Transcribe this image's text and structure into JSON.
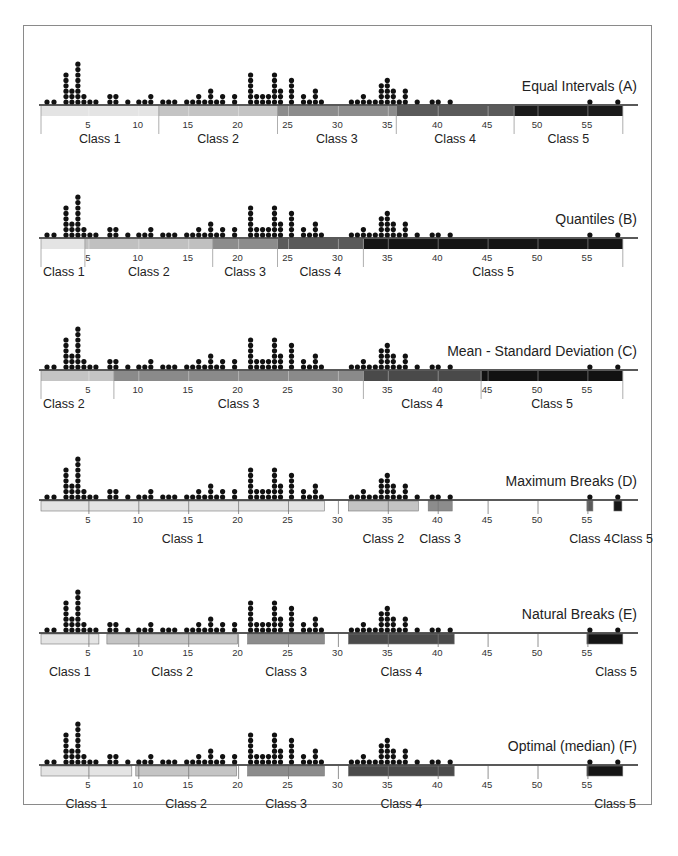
{
  "chart_data": {
    "type": "dot-strip",
    "xlabel": "",
    "ylabel": "",
    "xlim": [
      0,
      58
    ],
    "ticks": [
      5,
      10,
      15,
      20,
      25,
      30,
      35,
      40,
      45,
      50,
      55
    ],
    "dot_histogram": [
      {
        "x": 0.8,
        "n": 1
      },
      {
        "x": 1.5,
        "n": 1
      },
      {
        "x": 2.7,
        "n": 6
      },
      {
        "x": 3.3,
        "n": 3
      },
      {
        "x": 3.9,
        "n": 8
      },
      {
        "x": 4.5,
        "n": 2
      },
      {
        "x": 5.1,
        "n": 1
      },
      {
        "x": 5.7,
        "n": 1
      },
      {
        "x": 7.1,
        "n": 2
      },
      {
        "x": 7.7,
        "n": 2
      },
      {
        "x": 8.9,
        "n": 1
      },
      {
        "x": 10.0,
        "n": 1
      },
      {
        "x": 10.6,
        "n": 1
      },
      {
        "x": 11.2,
        "n": 2
      },
      {
        "x": 12.4,
        "n": 1
      },
      {
        "x": 13.0,
        "n": 1
      },
      {
        "x": 13.6,
        "n": 1
      },
      {
        "x": 14.8,
        "n": 1
      },
      {
        "x": 15.4,
        "n": 1
      },
      {
        "x": 16.0,
        "n": 2
      },
      {
        "x": 16.6,
        "n": 1
      },
      {
        "x": 17.2,
        "n": 3
      },
      {
        "x": 17.8,
        "n": 1
      },
      {
        "x": 18.4,
        "n": 2
      },
      {
        "x": 19.6,
        "n": 2
      },
      {
        "x": 21.2,
        "n": 6
      },
      {
        "x": 21.8,
        "n": 2
      },
      {
        "x": 22.4,
        "n": 2
      },
      {
        "x": 23.0,
        "n": 2
      },
      {
        "x": 23.6,
        "n": 6
      },
      {
        "x": 24.2,
        "n": 3
      },
      {
        "x": 25.3,
        "n": 5
      },
      {
        "x": 26.5,
        "n": 2
      },
      {
        "x": 27.1,
        "n": 1
      },
      {
        "x": 27.7,
        "n": 3
      },
      {
        "x": 28.3,
        "n": 1
      },
      {
        "x": 31.3,
        "n": 1
      },
      {
        "x": 31.9,
        "n": 1
      },
      {
        "x": 32.5,
        "n": 2
      },
      {
        "x": 33.1,
        "n": 1
      },
      {
        "x": 33.7,
        "n": 1
      },
      {
        "x": 34.3,
        "n": 4
      },
      {
        "x": 34.9,
        "n": 5
      },
      {
        "x": 35.5,
        "n": 3
      },
      {
        "x": 36.1,
        "n": 1
      },
      {
        "x": 36.7,
        "n": 3
      },
      {
        "x": 37.9,
        "n": 1
      },
      {
        "x": 39.4,
        "n": 1
      },
      {
        "x": 40.0,
        "n": 1
      },
      {
        "x": 41.2,
        "n": 1
      },
      {
        "x": 55.2,
        "n": 1
      },
      {
        "x": 58.0,
        "n": 1
      }
    ],
    "panels": [
      {
        "id": "A",
        "title": "Equal Intervals (A)",
        "classes": [
          {
            "label": "Class 1",
            "from": 0.2,
            "to": 12.0,
            "color": "#e4e4e4"
          },
          {
            "label": "Class 2",
            "from": 12.0,
            "to": 23.9,
            "color": "#c4c4c4"
          },
          {
            "label": "Class 3",
            "from": 23.9,
            "to": 35.8,
            "color": "#8c8c8c"
          },
          {
            "label": "Class 4",
            "from": 35.8,
            "to": 47.6,
            "color": "#5a5a5a"
          },
          {
            "label": "Class 5",
            "from": 47.6,
            "to": 58.5,
            "color": "#1a1a1a"
          }
        ],
        "bar": "continuous"
      },
      {
        "id": "B",
        "title": "Quantiles (B)",
        "classes": [
          {
            "label": "Class 1",
            "from": 0.2,
            "to": 4.6,
            "color": "#e4e4e4"
          },
          {
            "label": "Class 2",
            "from": 4.6,
            "to": 17.4,
            "color": "#c0c0c0"
          },
          {
            "label": "Class 3",
            "from": 17.4,
            "to": 23.9,
            "color": "#8c8c8c"
          },
          {
            "label": "Class 4",
            "from": 23.9,
            "to": 32.5,
            "color": "#5a5a5a"
          },
          {
            "label": "Class 5",
            "from": 32.5,
            "to": 58.5,
            "color": "#151515"
          }
        ],
        "bar": "continuous"
      },
      {
        "id": "C",
        "title": "Mean - Standard Deviation (C)",
        "classes": [
          {
            "label": "Class 2",
            "from": 0.2,
            "to": 7.5,
            "color": "#c4c4c4"
          },
          {
            "label": "Class 3",
            "from": 7.5,
            "to": 32.5,
            "color": "#8a8a8a"
          },
          {
            "label": "Class 4",
            "from": 32.5,
            "to": 44.3,
            "color": "#4a4a4a"
          },
          {
            "label": "Class 5",
            "from": 44.3,
            "to": 58.5,
            "color": "#121212"
          }
        ],
        "bar": "continuous"
      },
      {
        "id": "D",
        "title": "Maximum Breaks (D)",
        "classes": [
          {
            "label": "Class 1",
            "from": 0.2,
            "to": 28.6,
            "color": "#e4e4e4"
          },
          {
            "label": "Class 2",
            "from": 31.0,
            "to": 38.0,
            "color": "#c4c4c4"
          },
          {
            "label": "Class 3",
            "from": 39.0,
            "to": 41.4,
            "color": "#8c8c8c"
          },
          {
            "label": "Class 4",
            "from": 54.9,
            "to": 55.5,
            "color": "#5a5a5a"
          },
          {
            "label": "Class 5",
            "from": 57.6,
            "to": 58.4,
            "color": "#151515"
          }
        ],
        "bar": "segments"
      },
      {
        "id": "E",
        "title": "Natural Breaks (E)",
        "classes": [
          {
            "label": "Class 1",
            "from": 0.2,
            "to": 6.0,
            "color": "#e4e4e4"
          },
          {
            "label": "Class 2",
            "from": 6.8,
            "to": 19.9,
            "color": "#c4c4c4"
          },
          {
            "label": "Class 3",
            "from": 20.9,
            "to": 28.6,
            "color": "#8c8c8c"
          },
          {
            "label": "Class 4",
            "from": 31.0,
            "to": 41.6,
            "color": "#4a4a4a"
          },
          {
            "label": "Class 5",
            "from": 54.9,
            "to": 58.5,
            "color": "#151515"
          }
        ],
        "bar": "segments"
      },
      {
        "id": "F",
        "title": "Optimal (median) (F)",
        "classes": [
          {
            "label": "Class 1",
            "from": 0.2,
            "to": 9.3,
            "color": "#e4e4e4"
          },
          {
            "label": "Class 2",
            "from": 9.7,
            "to": 19.8,
            "color": "#c4c4c4"
          },
          {
            "label": "Class 3",
            "from": 20.9,
            "to": 28.6,
            "color": "#8c8c8c"
          },
          {
            "label": "Class 4",
            "from": 31.0,
            "to": 41.6,
            "color": "#4a4a4a"
          },
          {
            "label": "Class 5",
            "from": 54.9,
            "to": 58.5,
            "color": "#151515"
          }
        ],
        "bar": "segments"
      }
    ],
    "legend": "none",
    "grid": false
  }
}
